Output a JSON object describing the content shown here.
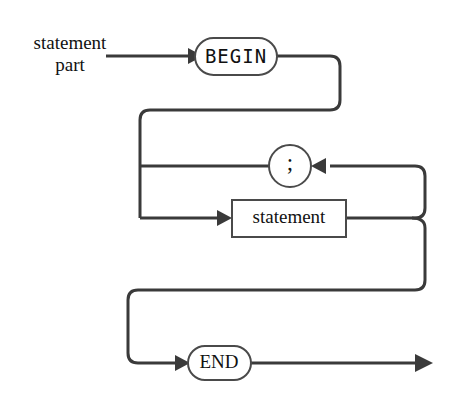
{
  "diagram": {
    "kind": "railroad-syntax-diagram",
    "title_lines": [
      "statement",
      "part"
    ],
    "line_color": "#3a3a3a",
    "node_border_color": "#4a4a4a",
    "node_fill": "#ffffff",
    "text_color": "#111111",
    "background": "#ffffff",
    "nodes": [
      {
        "id": "begin",
        "label": "BEGIN",
        "shape": "stadium",
        "font": "mono",
        "cx": 236,
        "cy": 56,
        "w": 82,
        "h": 37
      },
      {
        "id": "semicolon",
        "label": ";",
        "shape": "circle",
        "font": "serif",
        "cx": 290,
        "cy": 166,
        "r": 21
      },
      {
        "id": "statement",
        "label": "statement",
        "shape": "rect",
        "font": "serif",
        "cx": 289,
        "cy": 218,
        "w": 114,
        "h": 37
      },
      {
        "id": "end",
        "label": "END",
        "shape": "stadium",
        "font": "serif",
        "cx": 219,
        "cy": 363,
        "w": 63,
        "h": 34
      }
    ],
    "rails": {
      "entry": "Entry line from left into BEGIN",
      "begin_to_loop": "BEGIN exits right, curves down and back left",
      "semicolon_feedback": "Loop from statement output up and left through semicolon",
      "statement_path": "Left rail into statement box",
      "end_path": "Statement output down, left, then into END",
      "exit": "END exits right to terminal arrow"
    },
    "arrow_labels": {
      "entry_arrow": "arrow into BEGIN",
      "statement_arrow": "arrow into statement",
      "semicolon_arrow": "arrow into semicolon from right",
      "end_arrow": "arrow into END",
      "exit_arrow": "terminal exit arrow"
    }
  }
}
